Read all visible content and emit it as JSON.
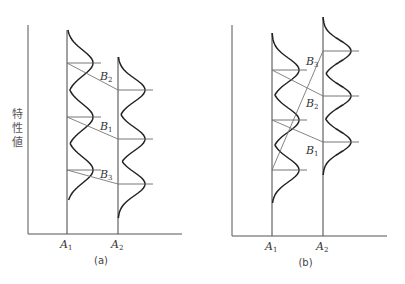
{
  "y_axis_label": "特性値",
  "panels": [
    {
      "caption": "(a)",
      "axis": {
        "x0": 28,
        "ytop": 25,
        "ybase": 234,
        "xend": 182
      },
      "columns": [
        {
          "label": "A",
          "sub": "1",
          "x": 67,
          "top": 30,
          "tail_top": 30,
          "tail_bot": 200,
          "peaks": [
            63,
            117,
            170
          ],
          "amp": 26
        },
        {
          "label": "A",
          "sub": "2",
          "x": 118,
          "top": 57,
          "tail_top": 57,
          "tail_bot": 218,
          "peaks": [
            90,
            139,
            184
          ],
          "amp": 27
        }
      ],
      "links": [
        {
          "label": "B",
          "sub": "2",
          "from": 63,
          "to": 90,
          "lx": 100,
          "ly": 80
        },
        {
          "label": "B",
          "sub": "1",
          "from": 117,
          "to": 139,
          "lx": 100,
          "ly": 130
        },
        {
          "label": "B",
          "sub": "3",
          "from": 170,
          "to": 184,
          "lx": 100,
          "ly": 178
        }
      ]
    },
    {
      "caption": "(b)",
      "axis": {
        "x0": 232,
        "ytop": 25,
        "ybase": 236,
        "xend": 387
      },
      "columns": [
        {
          "label": "A",
          "sub": "1",
          "x": 272,
          "top": 33,
          "tail_top": 33,
          "tail_bot": 203,
          "peaks": [
            70,
            120,
            170
          ],
          "amp": 27
        },
        {
          "label": "A",
          "sub": "2",
          "x": 323,
          "top": 17,
          "tail_top": 17,
          "tail_bot": 175,
          "peaks": [
            51,
            96,
            142
          ],
          "amp": 28
        }
      ],
      "links": [
        {
          "label": "B",
          "sub": "3",
          "from": 170,
          "to": 51,
          "lx": 306,
          "ly": 65
        },
        {
          "label": "B",
          "sub": "2",
          "from": 70,
          "to": 96,
          "lx": 306,
          "ly": 107
        },
        {
          "label": "B",
          "sub": "1",
          "from": 120,
          "to": 142,
          "lx": 306,
          "ly": 154
        }
      ]
    }
  ]
}
